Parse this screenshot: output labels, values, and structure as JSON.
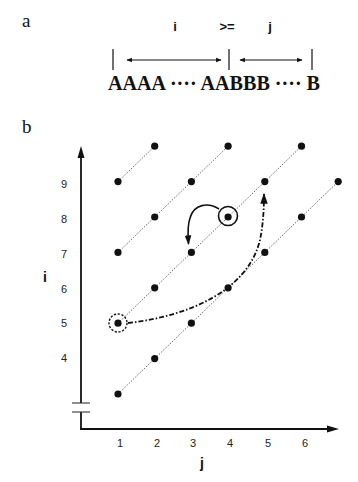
{
  "panel_a": {
    "label": "a",
    "top_labels": {
      "i": "i",
      "relation": ">=",
      "j": "j"
    },
    "sequence": "AAAA ···· AABBB ···· B",
    "segments": [
      {
        "name": "i-span",
        "from_x": 113,
        "to_x": 229
      },
      {
        "name": "j-span",
        "from_x": 229,
        "to_x": 312
      }
    ]
  },
  "panel_b": {
    "label": "b",
    "y_axis": {
      "title": "i",
      "ticks": [
        "4",
        "5",
        "6",
        "7",
        "8",
        "9"
      ],
      "break": true
    },
    "x_axis": {
      "title": "j",
      "ticks": [
        "1",
        "2",
        "3",
        "4",
        "5",
        "6"
      ]
    },
    "diagonals": [
      {
        "offset_i_minus_j": 8,
        "points": [
          [
            1,
            9
          ],
          [
            2,
            10
          ]
        ]
      },
      {
        "offset_i_minus_j": 6,
        "points": [
          [
            1,
            7
          ],
          [
            2,
            8
          ],
          [
            3,
            9
          ],
          [
            4,
            10
          ]
        ]
      },
      {
        "offset_i_minus_j": 4,
        "points": [
          [
            1,
            5
          ],
          [
            2,
            6
          ],
          [
            3,
            7
          ],
          [
            4,
            8
          ],
          [
            5,
            9
          ],
          [
            6,
            10
          ]
        ]
      },
      {
        "offset_i_minus_j": 2,
        "points": [
          [
            1,
            3
          ],
          [
            2,
            4
          ],
          [
            3,
            5
          ],
          [
            4,
            6
          ],
          [
            5,
            7
          ],
          [
            6,
            8
          ],
          [
            7,
            9
          ]
        ]
      }
    ],
    "highlights": [
      {
        "type": "solid-circle",
        "point": [
          4,
          8
        ]
      },
      {
        "type": "dashed-circle",
        "point": [
          1,
          5
        ]
      }
    ],
    "arrows": [
      {
        "style": "solid-curved",
        "from": [
          4,
          8
        ],
        "to": [
          3,
          7
        ]
      },
      {
        "style": "dash-dot-curved",
        "from": [
          1,
          5
        ],
        "to": [
          5,
          9
        ]
      }
    ]
  }
}
